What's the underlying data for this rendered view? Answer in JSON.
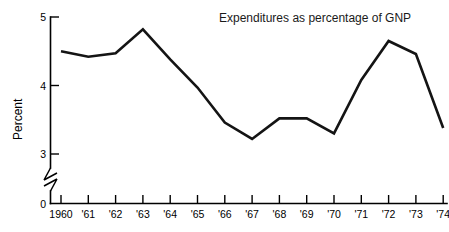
{
  "chart_data": {
    "type": "line",
    "title": "Expenditures as percentage of GNP",
    "xlabel": "",
    "ylabel": "Percent",
    "categories": [
      "1960",
      "'61",
      "'62",
      "'63",
      "'64",
      "'65",
      "'66",
      "'67",
      "'68",
      "'69",
      "'70",
      "'71",
      "'72",
      "'73",
      "'74"
    ],
    "x_values": [
      1960,
      1961,
      1962,
      1963,
      1964,
      1965,
      1966,
      1967,
      1968,
      1969,
      1970,
      1971,
      1972,
      1973,
      1974
    ],
    "values": [
      4.5,
      4.42,
      4.47,
      4.82,
      4.38,
      3.97,
      3.46,
      3.22,
      3.52,
      3.52,
      3.3,
      4.08,
      4.65,
      4.46,
      3.38
    ],
    "series": [
      {
        "name": "Expenditures as percentage of GNP",
        "values": [
          4.5,
          4.42,
          4.47,
          4.82,
          4.38,
          3.97,
          3.46,
          3.22,
          3.52,
          3.52,
          3.3,
          4.08,
          4.65,
          4.46,
          3.38
        ]
      }
    ],
    "ylim": [
      0,
      5
    ],
    "y_ticks": [
      0,
      3,
      4,
      5
    ],
    "y_tick_labels": [
      "0",
      "3",
      "4",
      "5"
    ],
    "y_axis_break": true,
    "y_axis_break_between": [
      0,
      3
    ],
    "grid": false,
    "legend": false,
    "line_color": "#141414",
    "axis_color": "#000000",
    "background_color": "#ffffff"
  },
  "annotations": {
    "title_text": "Expenditures as percentage of GNP",
    "y_axis_title": "Percent"
  }
}
